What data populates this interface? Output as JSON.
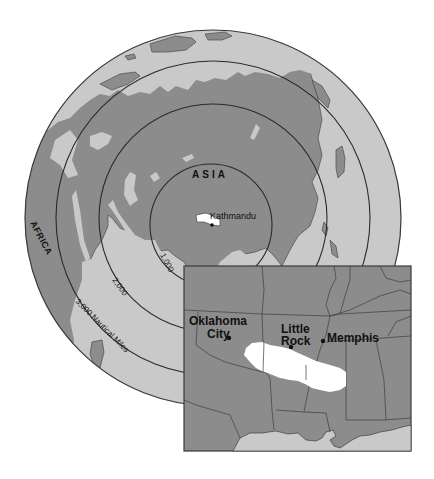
{
  "globe": {
    "region_label": "ASIA",
    "continent_label": "AFRICA",
    "center_city": {
      "name": "Kathmandu"
    },
    "range_rings": [
      {
        "label": "1,000"
      },
      {
        "label": "2,000"
      },
      {
        "label": "3,000 Nautical Miles"
      }
    ]
  },
  "inset": {
    "cities": [
      {
        "name_line1": "Oklahoma",
        "name_line2": "City"
      },
      {
        "name_line1": "Little",
        "name_line2": "Rock"
      },
      {
        "name_line1": "Memphis",
        "name_line2": ""
      }
    ]
  },
  "colors": {
    "land": "#8c8c8c",
    "ocean": "#c9c9c9",
    "highlight": "#ffffff",
    "lines": "#2a2a2a"
  }
}
